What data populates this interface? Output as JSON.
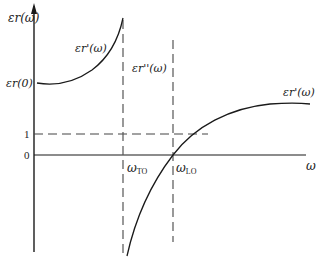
{
  "diagram": {
    "y_axis_label": "εr(ω)",
    "x_axis_label": "ω",
    "y_ticks": [
      {
        "label": "εr(0)",
        "y": 83
      },
      {
        "label": "1",
        "y": 134
      },
      {
        "label": "0",
        "y": 155
      }
    ],
    "x_ticks": [
      {
        "label_main": "ω",
        "label_sub": "TO",
        "x": 123
      },
      {
        "label_main": "ω",
        "label_sub": "LO",
        "x": 173
      }
    ],
    "curve_labels": {
      "left_branch": "εr'(ω)",
      "pole": "εr''(ω)",
      "right_branch": "εr'(ω)"
    },
    "colors": {
      "line": "#1a1a1a",
      "dashed": "#444444"
    }
  }
}
